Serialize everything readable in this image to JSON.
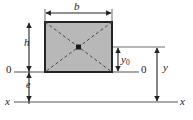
{
  "figure": {
    "type": "engineering-cross-section-diagram",
    "canvas": {
      "width": 193,
      "height": 120
    },
    "colors": {
      "background": "#ffffff",
      "section_fill": "#b8b8b8",
      "section_stroke": "#232323",
      "diagonal_stroke": "#4a4a4a",
      "dimension_stroke": "#232323",
      "axis_stroke": "#8c8c8c",
      "centroid_marker": "#1a1a1a",
      "label_color": "#1a1a1a"
    },
    "section": {
      "name": "rectangle",
      "x": 45,
      "y": 22,
      "width": 67,
      "height": 50,
      "fill": "#b8b8b8",
      "stroke": "#232323",
      "stroke_width": 2
    },
    "centroid": {
      "cx": 78.5,
      "cy": 47,
      "size": 5
    },
    "labels": {
      "width_dim": "b",
      "height_dim": "h",
      "origin_left": "0",
      "eccentricity": "e",
      "axis_left": "x",
      "centroid_offset": "y",
      "centroid_offset_sub": "0",
      "origin_right": "0",
      "total_distance": "y",
      "axis_right": "x"
    },
    "dimension_lines": [
      {
        "name": "b",
        "orientation": "horizontal",
        "from": [
          45,
          13
        ],
        "to": [
          112,
          13
        ],
        "arrows": "both"
      },
      {
        "name": "h",
        "orientation": "vertical",
        "from": [
          29,
          22
        ],
        "to": [
          29,
          72
        ],
        "arrows": "both"
      },
      {
        "name": "e",
        "orientation": "vertical",
        "from": [
          29,
          72
        ],
        "to": [
          29,
          102
        ],
        "arrows": "both"
      },
      {
        "name": "y0",
        "orientation": "vertical",
        "from": [
          118,
          47
        ],
        "to": [
          118,
          72
        ],
        "arrows": "both"
      },
      {
        "name": "y",
        "orientation": "vertical",
        "from": [
          157,
          47
        ],
        "to": [
          157,
          102
        ],
        "arrows": "both"
      }
    ],
    "axes": [
      {
        "name": "neutral-axis-0-0",
        "orientation": "horizontal",
        "y": 72,
        "from_x": 14,
        "to_x": 139
      },
      {
        "name": "reference-axis-x-x",
        "orientation": "horizontal",
        "y": 102,
        "from_x": 14,
        "to_x": 178
      }
    ],
    "diagonals": [
      {
        "from": [
          45,
          22
        ],
        "to": [
          112,
          72
        ]
      },
      {
        "from": [
          112,
          22
        ],
        "to": [
          45,
          72
        ]
      }
    ]
  }
}
